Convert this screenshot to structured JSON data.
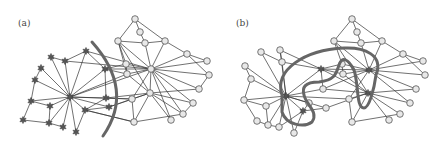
{
  "panels": [
    {
      "id": "a",
      "label": "(a)"
    },
    {
      "id": "b",
      "label": "(b)"
    }
  ],
  "colors": {
    "node_fill": "#e8e8e8",
    "star_fill": "#555555",
    "edge": "#333333",
    "cut": "#666666"
  }
}
